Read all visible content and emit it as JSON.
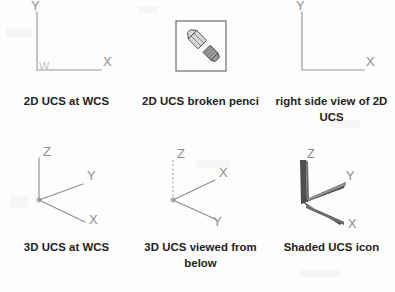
{
  "page": {
    "background_color": "#fdfdfd",
    "caption_color": "#231f20",
    "line_color": "#9a9a9a",
    "shaded_icon_color": "#4e4e4e"
  },
  "figures": [
    {
      "id": "2d-ucs-at-wcs",
      "caption": "2D UCS at WCS",
      "icon": "2d-ucs-icon",
      "labels": {
        "y": "Y",
        "x": "X",
        "origin": "W"
      }
    },
    {
      "id": "2d-ucs-broken-pencil",
      "caption": "2D UCS broken penci",
      "icon": "broken-pencil-icon",
      "labels": {}
    },
    {
      "id": "right-side-view-2d-ucs",
      "caption": "right side view of 2D UCS",
      "icon": "2d-ucs-icon-no-origin",
      "labels": {
        "y": "Y",
        "x": "X"
      }
    },
    {
      "id": "3d-ucs-at-wcs",
      "caption": "3D UCS at WCS",
      "icon": "3d-ucs-icon",
      "labels": {
        "z": "Z",
        "y": "Y",
        "x": "X"
      }
    },
    {
      "id": "3d-ucs-viewed-from-below",
      "caption": "3D UCS viewed from below",
      "icon": "3d-ucs-icon-below",
      "labels": {
        "z": "Z",
        "x": "X",
        "y": "Y"
      }
    },
    {
      "id": "shaded-ucs-icon",
      "caption": "Shaded UCS icon",
      "icon": "shaded-ucs-icon",
      "labels": {
        "z": "Z",
        "y": "Y",
        "x": "X"
      }
    }
  ]
}
